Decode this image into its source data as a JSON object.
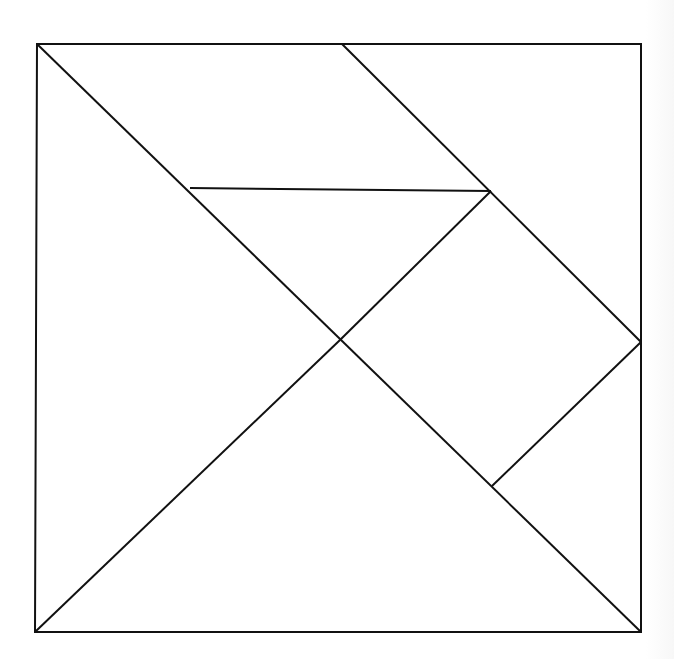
{
  "diagram": {
    "type": "tangram",
    "stroke_color": "#111111",
    "background_color": "#ffffff",
    "frame": {
      "x1": 37,
      "y1": 44,
      "x2": 641,
      "y2": 44,
      "x3": 641,
      "y3": 632,
      "x4": 35,
      "y4": 632
    },
    "segments": [
      {
        "name": "main-diagonal",
        "x1": 37,
        "y1": 44,
        "x2": 641,
        "y2": 632
      },
      {
        "name": "anti-diagonal-lower",
        "x1": 35,
        "y1": 632,
        "x2": 340,
        "y2": 340
      },
      {
        "name": "anti-diagonal-upper",
        "x1": 340,
        "y1": 340,
        "x2": 491,
        "y2": 191
      },
      {
        "name": "top-diagonal",
        "x1": 342,
        "y1": 44,
        "x2": 641,
        "y2": 342
      },
      {
        "name": "horizontal-mid",
        "x1": 190,
        "y1": 188,
        "x2": 491,
        "y2": 191
      },
      {
        "name": "square-lower-edge",
        "x1": 641,
        "y1": 342,
        "x2": 492,
        "y2": 486
      }
    ]
  }
}
